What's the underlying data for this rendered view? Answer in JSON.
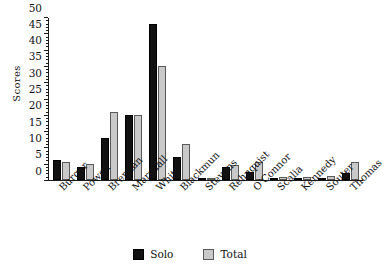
{
  "chart_data": {
    "type": "bar",
    "title": "",
    "xlabel": "",
    "ylabel": "Scores",
    "ylim": [
      0,
      50
    ],
    "ytick_step": 5,
    "yminor_step": 1,
    "grid": false,
    "legend_position": "bottom",
    "categories": [
      "Burger",
      "Powell",
      "Brennan",
      "Marshall",
      "White",
      "Blackmun",
      "Stevens",
      "Rehnquist",
      "O'Connor",
      "Scalia",
      "Kennedy",
      "Souter",
      "Thomas"
    ],
    "ytick_labels": [
      "0",
      "5",
      "10",
      "15",
      "20",
      "25",
      "30",
      "35",
      "40",
      "45",
      "50"
    ],
    "series": [
      {
        "name": "Solo",
        "color": "#111111",
        "values": [
          6,
          4,
          13,
          20,
          48,
          7,
          0.3,
          4,
          2.5,
          0.7,
          0.7,
          0.5,
          2
        ]
      },
      {
        "name": "Total",
        "color": "#c9c9c9",
        "values": [
          5.5,
          5,
          21,
          20,
          35,
          11,
          0.7,
          4.5,
          5.5,
          1,
          1,
          1.3,
          5.5
        ]
      }
    ]
  },
  "legend": {
    "items": [
      {
        "label": "Solo",
        "swatch": "solo-swatch"
      },
      {
        "label": "Total",
        "swatch": "total-swatch"
      }
    ]
  }
}
